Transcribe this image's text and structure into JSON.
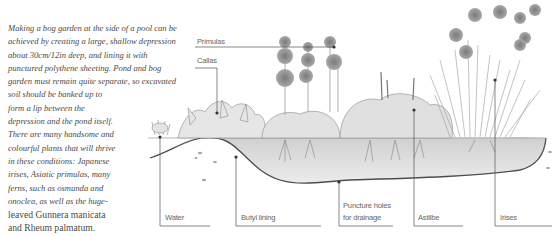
{
  "description": {
    "lines": [
      "Making a bog garden at the side of a pool can be",
      "achieved by creating a large, shallow depression",
      "about 30cm/12in deep, and lining it with",
      "punctured polythene sheeting. Pond and bog",
      "garden must remain quite separate, so excavated",
      "soil should be banked up to",
      "form a lip between the",
      "depression and the pond itself.",
      "There are many handsome and",
      "colourful plants that will thrive",
      "in these conditions: Japanese",
      "irises, Asiatic primulas, many",
      "ferns, such as osmunda and",
      "onoclea, as well as the huge-",
      "leaved Gunnera manicata",
      "and Rheum palmatum."
    ]
  },
  "diagram": {
    "labels": {
      "primulas": "Primulas",
      "callas": "Callas",
      "water": "Water",
      "butyl_lining": "Butyl lining",
      "puncture_holes_1": "Puncture holes",
      "puncture_holes_2": "for drainage",
      "astilbe": "Astilbe",
      "irises": "Irises"
    },
    "colors": {
      "line": "#555555",
      "soil": "#d9d9d9",
      "plant": "#8a8a8a",
      "text": "#4a4a4a"
    }
  }
}
